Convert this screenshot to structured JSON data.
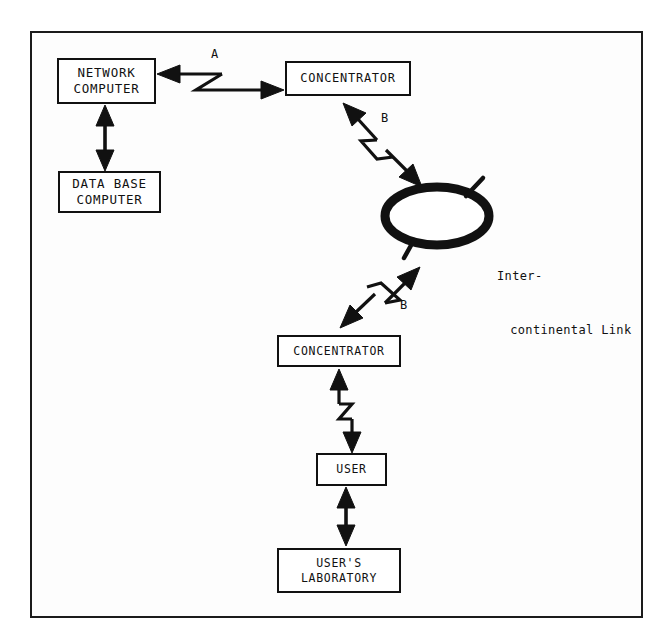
{
  "diagram": {
    "background_color": "#fdfdfd",
    "ink_color": "#111111",
    "frame": {
      "present": true,
      "border_color": "#1b1b1b"
    }
  },
  "nodes": [
    {
      "id": "network-computer",
      "line1": "NETWORK",
      "line2": "COMPUTER",
      "shape": "rectangle"
    },
    {
      "id": "database-computer",
      "line1": "DATA BASE",
      "line2": "COMPUTER",
      "shape": "rectangle"
    },
    {
      "id": "concentrator-top",
      "line1": "CONCENTRATOR",
      "line2": "",
      "shape": "rectangle"
    },
    {
      "id": "satellite",
      "line1": "SATELLITE",
      "line2": "",
      "shape": "ellipse"
    },
    {
      "id": "concentrator-bottom",
      "line1": "CONCENTRATOR",
      "line2": "",
      "shape": "rectangle"
    },
    {
      "id": "user",
      "line1": "USER",
      "line2": "",
      "shape": "rectangle"
    },
    {
      "id": "users-laboratory",
      "line1": "USER'S",
      "line2": "LABORATORY",
      "shape": "rectangle"
    }
  ],
  "links": [
    {
      "id": "network-to-concentrator",
      "label": "A",
      "style": "zigzag-double-arrow",
      "from": "network-computer",
      "to": "concentrator-top"
    },
    {
      "id": "network-to-database",
      "label": "",
      "style": "plain-double-arrow",
      "from": "network-computer",
      "to": "database-computer"
    },
    {
      "id": "concentrator-to-satellite-up",
      "label": "B",
      "style": "zigzag-double-arrow",
      "from": "concentrator-top",
      "to": "satellite"
    },
    {
      "id": "satellite-to-concentrator-down",
      "label": "B",
      "style": "zigzag-double-arrow",
      "from": "satellite",
      "to": "concentrator-bottom"
    },
    {
      "id": "concentrator-to-user",
      "label": "",
      "style": "zigzag-double-arrow",
      "from": "concentrator-bottom",
      "to": "user"
    },
    {
      "id": "user-to-laboratory",
      "label": "",
      "style": "plain-double-arrow",
      "from": "user",
      "to": "users-laboratory"
    }
  ],
  "annotations": {
    "intercontinental": {
      "line1": "Inter-",
      "line2": "continental Link"
    }
  }
}
